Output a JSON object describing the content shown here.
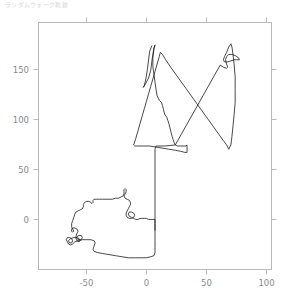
{
  "title": {
    "text": "ランダムウォーク軌跡",
    "color": "#d8d8d8"
  },
  "figure": {
    "background": "#ffffff",
    "frame_color": "#b9b9b9",
    "tick_color": "#b9b9b9",
    "label_color": "#8a8a8a",
    "line_color": "#1a1a1a"
  },
  "chart_data": {
    "type": "line",
    "title": "ランダムウォーク軌跡",
    "xlabel": "",
    "ylabel": "",
    "grid": false,
    "legend": null,
    "xlim": [
      -88,
      130
    ],
    "ylim": [
      -47,
      185
    ],
    "xticks": [
      -50,
      0,
      50,
      100
    ],
    "yticks": [
      0,
      50,
      100,
      150
    ],
    "xtick_labels": [
      "-50",
      "0",
      "50",
      "100"
    ],
    "ytick_labels": [
      "0",
      "50",
      "100",
      "150"
    ],
    "series": [
      {
        "name": "trajectory",
        "color": "#1a1a1a",
        "linewidth": 0.8,
        "points": [
          [
            18,
            163
          ],
          [
            16,
            158
          ],
          [
            15,
            150
          ],
          [
            14,
            142
          ],
          [
            13,
            135
          ],
          [
            12,
            130
          ],
          [
            11,
            126
          ],
          [
            10,
            124
          ],
          [
            12,
            127
          ],
          [
            15,
            133
          ],
          [
            17,
            140
          ],
          [
            18,
            148
          ],
          [
            19,
            155
          ],
          [
            20,
            161
          ],
          [
            21,
            164
          ],
          [
            20,
            160
          ],
          [
            19,
            152
          ],
          [
            19,
            144
          ],
          [
            20,
            136
          ],
          [
            21,
            129
          ],
          [
            22,
            122
          ],
          [
            23,
            116
          ],
          [
            25,
            112
          ],
          [
            27,
            110
          ],
          [
            28,
            107
          ],
          [
            29,
            103
          ],
          [
            30,
            99
          ],
          [
            32,
            96
          ],
          [
            33,
            93
          ],
          [
            34,
            90
          ],
          [
            35,
            86
          ],
          [
            36,
            82
          ],
          [
            37,
            78
          ],
          [
            38,
            75
          ],
          [
            39,
            72
          ],
          [
            40,
            70
          ],
          [
            42,
            69
          ],
          [
            45,
            69
          ],
          [
            48,
            69
          ],
          [
            50,
            69
          ],
          [
            51,
            70
          ],
          [
            51,
            66
          ],
          [
            51,
            63
          ],
          [
            49,
            63
          ],
          [
            45,
            64
          ],
          [
            40,
            65
          ],
          [
            34,
            66
          ],
          [
            28,
            67
          ],
          [
            22,
            68
          ],
          [
            16,
            69
          ],
          [
            10,
            69
          ],
          [
            5,
            69
          ],
          [
            2,
            69
          ],
          [
            1,
            70
          ],
          [
            3,
            76
          ],
          [
            5,
            83
          ],
          [
            7,
            90
          ],
          [
            9,
            97
          ],
          [
            11,
            104
          ],
          [
            13,
            111
          ],
          [
            15,
            118
          ],
          [
            17,
            125
          ],
          [
            19,
            132
          ],
          [
            21,
            139
          ],
          [
            23,
            146
          ],
          [
            25,
            153
          ],
          [
            26,
            157
          ],
          [
            28,
            155
          ],
          [
            31,
            150
          ],
          [
            35,
            144
          ],
          [
            40,
            137
          ],
          [
            45,
            130
          ],
          [
            50,
            123
          ],
          [
            55,
            116
          ],
          [
            60,
            109
          ],
          [
            65,
            102
          ],
          [
            70,
            95
          ],
          [
            75,
            88
          ],
          [
            80,
            81
          ],
          [
            85,
            74
          ],
          [
            88,
            70
          ],
          [
            90,
            66
          ],
          [
            92,
            70
          ],
          [
            93,
            78
          ],
          [
            94,
            88
          ],
          [
            95,
            98
          ],
          [
            96,
            110
          ],
          [
            96,
            122
          ],
          [
            96,
            134
          ],
          [
            95,
            146
          ],
          [
            94,
            155
          ],
          [
            93,
            162
          ],
          [
            92,
            165
          ],
          [
            90,
            162
          ],
          [
            88,
            157
          ],
          [
            86,
            153
          ],
          [
            85,
            150
          ],
          [
            86,
            148
          ],
          [
            89,
            148
          ],
          [
            92,
            149
          ],
          [
            95,
            150
          ],
          [
            98,
            150
          ],
          [
            100,
            150
          ],
          [
            99,
            152
          ],
          [
            96,
            154
          ],
          [
            93,
            155
          ],
          [
            90,
            155
          ],
          [
            88,
            153
          ],
          [
            87,
            150
          ],
          [
            88,
            146
          ],
          [
            89,
            143
          ],
          [
            88,
            142
          ],
          [
            85,
            143
          ],
          [
            82,
            145
          ],
          [
            40,
            70
          ],
          [
            30,
            69
          ],
          [
            22,
            69
          ],
          [
            21,
            66
          ],
          [
            21,
            60
          ],
          [
            21,
            52
          ],
          [
            21,
            44
          ],
          [
            21,
            36
          ],
          [
            21,
            28
          ],
          [
            21,
            20
          ],
          [
            21,
            12
          ],
          [
            21,
            4
          ],
          [
            21,
            -4
          ],
          [
            21,
            -12
          ],
          [
            21,
            -20
          ],
          [
            21,
            -26
          ],
          [
            21,
            -31
          ],
          [
            20,
            -34
          ],
          [
            17,
            -35
          ],
          [
            13,
            -36
          ],
          [
            8,
            -36
          ],
          [
            2,
            -36
          ],
          [
            -4,
            -36
          ],
          [
            -10,
            -35
          ],
          [
            -16,
            -34
          ],
          [
            -22,
            -33
          ],
          [
            -28,
            -32
          ],
          [
            -33,
            -31
          ],
          [
            -36,
            -30
          ],
          [
            -37,
            -28
          ],
          [
            -36,
            -25
          ],
          [
            -35,
            -22
          ],
          [
            -36,
            -20
          ],
          [
            -39,
            -19
          ],
          [
            -43,
            -19
          ],
          [
            -47,
            -19
          ],
          [
            -51,
            -20
          ],
          [
            -54,
            -21
          ],
          [
            -56,
            -23
          ],
          [
            -58,
            -24
          ],
          [
            -60,
            -23
          ],
          [
            -61,
            -21
          ],
          [
            -62,
            -19
          ],
          [
            -61,
            -17
          ],
          [
            -59,
            -17
          ],
          [
            -57,
            -18
          ],
          [
            -56,
            -20
          ],
          [
            -57,
            -22
          ],
          [
            -59,
            -22
          ],
          [
            -60,
            -20
          ],
          [
            -58,
            -18
          ],
          [
            -55,
            -17
          ],
          [
            -52,
            -17
          ],
          [
            -50,
            -18
          ],
          [
            -49,
            -20
          ],
          [
            -50,
            -21
          ],
          [
            -52,
            -20
          ],
          [
            -53,
            -18
          ],
          [
            -52,
            -16
          ],
          [
            -50,
            -15
          ],
          [
            -48,
            -15
          ],
          [
            -47,
            -17
          ],
          [
            -48,
            -19
          ],
          [
            -50,
            -19
          ],
          [
            -52,
            -18
          ],
          [
            -53,
            -16
          ],
          [
            -52,
            -13
          ],
          [
            -51,
            -11
          ],
          [
            -52,
            -9
          ],
          [
            -54,
            -8
          ],
          [
            -56,
            -8
          ],
          [
            -57,
            -9
          ],
          [
            -57,
            -11
          ],
          [
            -56,
            -12
          ],
          [
            -55,
            -11
          ],
          [
            -56,
            -9
          ],
          [
            -57,
            -7
          ],
          [
            -57,
            -4
          ],
          [
            -56,
            -1
          ],
          [
            -55,
            2
          ],
          [
            -54,
            5
          ],
          [
            -53,
            7
          ],
          [
            -51,
            8
          ],
          [
            -49,
            9
          ],
          [
            -47,
            10
          ],
          [
            -46,
            12
          ],
          [
            -46,
            14
          ],
          [
            -45,
            16
          ],
          [
            -43,
            17
          ],
          [
            -41,
            17
          ],
          [
            -39,
            16
          ],
          [
            -38,
            15
          ],
          [
            -37,
            16
          ],
          [
            -37,
            18
          ],
          [
            -36,
            19
          ],
          [
            -34,
            19
          ],
          [
            -31,
            19
          ],
          [
            -28,
            19
          ],
          [
            -25,
            19
          ],
          [
            -22,
            19
          ],
          [
            -19,
            19
          ],
          [
            -16,
            20
          ],
          [
            -13,
            20
          ],
          [
            -11,
            21
          ],
          [
            -9,
            22
          ],
          [
            -8,
            24
          ],
          [
            -8,
            26
          ],
          [
            -8,
            28
          ],
          [
            -7,
            29
          ],
          [
            -6,
            28
          ],
          [
            -6,
            26
          ],
          [
            -7,
            24
          ],
          [
            -8,
            22
          ],
          [
            -7,
            20
          ],
          [
            -5,
            19
          ],
          [
            -3,
            18
          ],
          [
            -2,
            16
          ],
          [
            -2,
            14
          ],
          [
            -3,
            12
          ],
          [
            -4,
            10
          ],
          [
            -5,
            8
          ],
          [
            -6,
            6
          ],
          [
            -6,
            4
          ],
          [
            -5,
            2
          ],
          [
            -3,
            1
          ],
          [
            -1,
            1
          ],
          [
            1,
            2
          ],
          [
            2,
            4
          ],
          [
            1,
            6
          ],
          [
            -1,
            7
          ],
          [
            -3,
            7
          ],
          [
            -4,
            5
          ],
          [
            -3,
            3
          ],
          [
            -1,
            2
          ],
          [
            1,
            1
          ],
          [
            3,
            0
          ],
          [
            5,
            0
          ],
          [
            7,
            1
          ],
          [
            9,
            1
          ],
          [
            11,
            1
          ],
          [
            13,
            1
          ],
          [
            15,
            0
          ],
          [
            17,
            0
          ],
          [
            19,
            0
          ],
          [
            21,
            0
          ],
          [
            21,
            -4
          ],
          [
            21,
            -10
          ]
        ]
      }
    ]
  }
}
